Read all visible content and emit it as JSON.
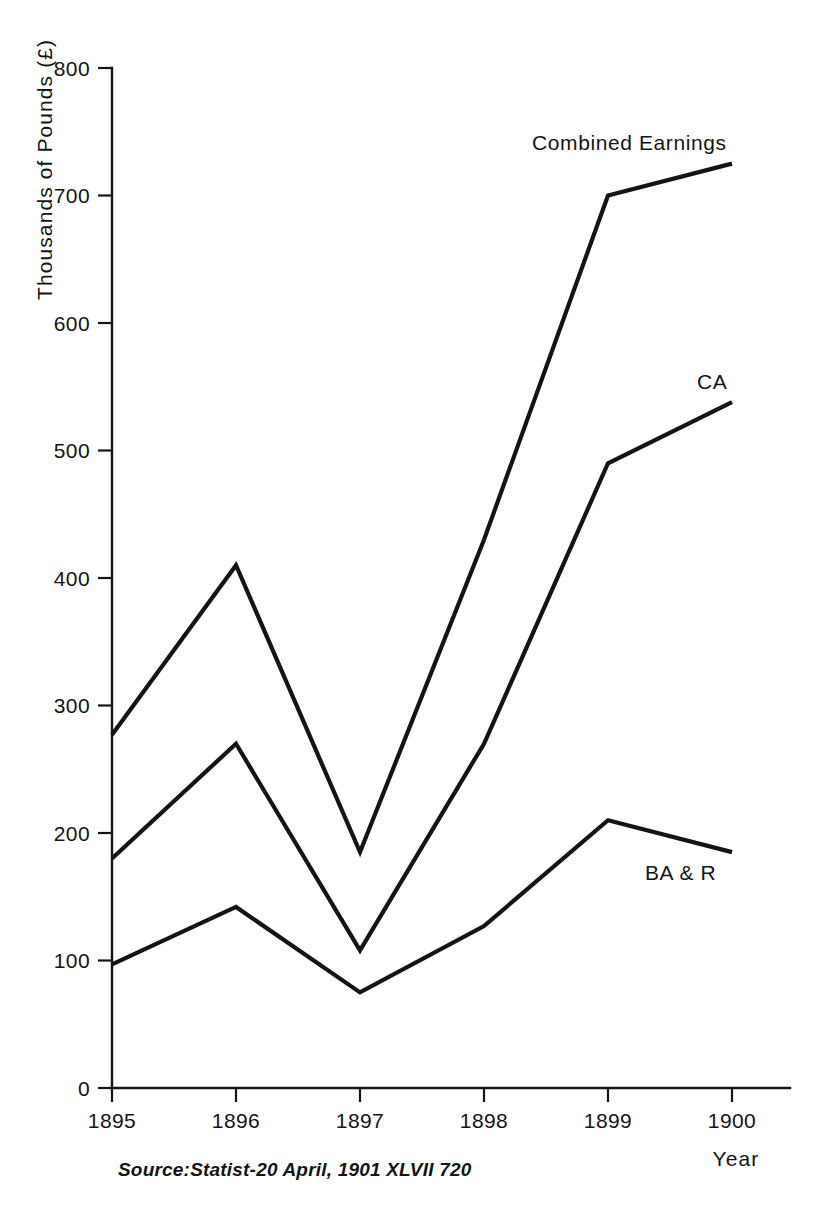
{
  "figure": {
    "background_color": "#ffffff",
    "ink_color": "#141414"
  },
  "axes": {
    "y_axis_title": "Thousands of Pounds (£)",
    "x_axis_title": "Year",
    "y_ticks": [
      "0",
      "100",
      "200",
      "300",
      "400",
      "500",
      "600",
      "700",
      "800"
    ],
    "x_ticks": [
      "1895",
      "1896",
      "1897",
      "1898",
      "1899",
      "1900"
    ]
  },
  "series_labels": {
    "combined": "Combined Earnings",
    "ca": "CA",
    "bar": "BA & R"
  },
  "source": {
    "text": "Source:Statist-20 April, 1901 XLVII 720"
  },
  "chart_data": {
    "type": "line",
    "title": "",
    "xlabel": "Year",
    "ylabel": "Thousands of Pounds (£)",
    "x": [
      1895,
      1896,
      1897,
      1898,
      1899,
      1900
    ],
    "xlim": [
      1895,
      1900
    ],
    "ylim": [
      0,
      800
    ],
    "ytick_values": [
      0,
      100,
      200,
      300,
      400,
      500,
      600,
      700,
      800
    ],
    "xtick_values": [
      1895,
      1896,
      1897,
      1898,
      1899,
      1900
    ],
    "grid": false,
    "legend": "inline-labels",
    "series": [
      {
        "name": "Combined Earnings",
        "values": [
          277,
          410,
          185,
          430,
          700,
          725
        ],
        "label_position": "above-right-end"
      },
      {
        "name": "CA",
        "values": [
          180,
          270,
          108,
          270,
          490,
          538
        ],
        "label_position": "above-right-end"
      },
      {
        "name": "BA & R",
        "values": [
          97,
          142,
          75,
          127,
          210,
          185
        ],
        "label_position": "below-right-end"
      }
    ],
    "annotations": [
      {
        "text": "Combined Earnings",
        "x": 1899.3,
        "y": 755
      },
      {
        "text": "CA",
        "x": 1899.75,
        "y": 565
      },
      {
        "text": "BA & R",
        "x": 1899.3,
        "y": 158
      },
      {
        "text": "Source:Statist-20 April, 1901 XLVII 720",
        "x": 1895.2,
        "y": -80
      }
    ]
  }
}
